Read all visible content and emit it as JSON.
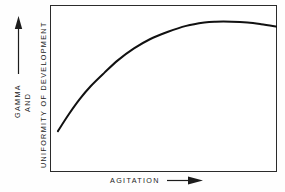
{
  "figure": {
    "background_color": "#fefefe",
    "ink_color": "#1c1c1c",
    "frame_color": "#2b2b2b"
  },
  "axes": {
    "y": {
      "label_lines": [
        "GAMMA",
        "AND",
        "UNIFORMITY OF DEVELOPMENT"
      ],
      "gamma_label": "GAMMA",
      "and_label": "AND",
      "uniformity_label": "UNIFORMITY OF DEVELOPMENT",
      "arrow": "up-arrow",
      "ticks": [],
      "tick_labels": []
    },
    "x": {
      "label": "AGITATION",
      "arrow": "right-arrow",
      "ticks": [],
      "tick_labels": []
    }
  },
  "chart_data": {
    "type": "line",
    "title": "",
    "subtitle": "",
    "xlabel": "AGITATION",
    "ylabel": "GAMMA AND UNIFORMITY OF DEVELOPMENT",
    "xlim": [
      0,
      100
    ],
    "ylim": [
      0,
      100
    ],
    "grid": false,
    "legend": null,
    "legend_position": "none",
    "axis_tick_labels": false,
    "annotations": [
      "x-axis arrow indicates increasing agitation",
      "y-axis arrow indicates increasing gamma and uniformity"
    ],
    "series": [
      {
        "name": "Gamma and uniformity of development",
        "line_color": "#111111",
        "line_width": 2,
        "x": [
          3.5,
          8,
          13,
          18,
          24,
          30,
          37,
          44,
          52,
          60,
          68,
          73,
          80,
          87,
          93,
          100
        ],
        "y": [
          24.5,
          34,
          43.5,
          51.5,
          59.5,
          67,
          74,
          79.5,
          84,
          87.5,
          89.5,
          90,
          90,
          89.5,
          88.5,
          87
        ]
      }
    ]
  }
}
